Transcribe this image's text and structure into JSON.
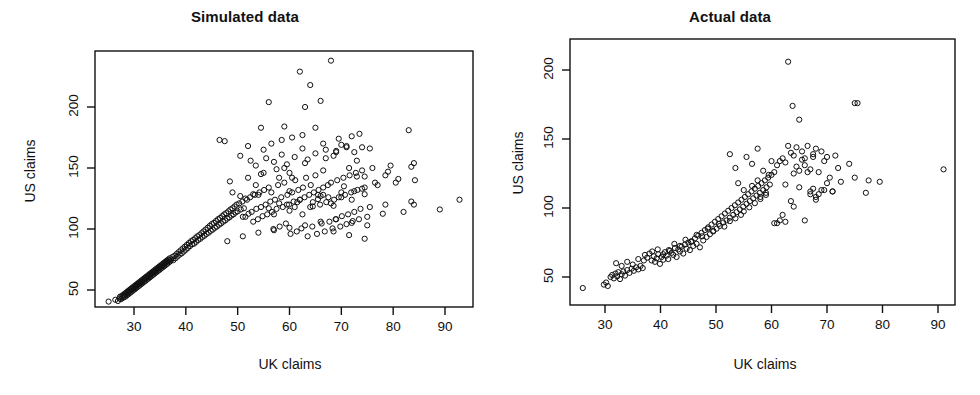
{
  "figure": {
    "width": 980,
    "height": 395,
    "background": "#ffffff",
    "foreground": "#111111",
    "marker": {
      "shape": "open-circle",
      "radius": 2.6,
      "stroke": "#111111",
      "stroke_width": 1.0
    }
  },
  "panels": [
    {
      "id": "left",
      "title": "Simulated data",
      "xlabel": "UK claims",
      "ylabel": "US claims"
    },
    {
      "id": "right",
      "title": "Actual data",
      "xlabel": "UK claims",
      "ylabel": "US claims"
    }
  ],
  "chart_data": [
    {
      "type": "scatter",
      "title": "Simulated data",
      "xlabel": "UK claims",
      "ylabel": "US claims",
      "xticks": [
        30,
        40,
        50,
        60,
        70,
        80,
        90
      ],
      "yticks": [
        50,
        100,
        150,
        200
      ],
      "xlim": [
        23.0,
        96.0
      ],
      "ylim": [
        33.0,
        245.0
      ],
      "grid": false,
      "legend": null,
      "n_points": 700,
      "point_marker": "open circle",
      "description": "Dense positively correlated cloud fanning out; tight narrow band from (25,40) up to about (50,100), widening strongly beyond UK=50 with spread from US~75 to US~240; sparse high-leverage points out to UK~93.",
      "x": [
        25.1,
        26.4,
        26.9,
        27.2,
        27.3,
        27.5,
        27.6,
        27.8,
        27.9,
        28.0,
        28.1,
        28.2,
        28.3,
        28.4,
        28.5,
        28.6,
        28.7,
        28.8,
        28.9,
        29.0,
        29.1,
        29.2,
        29.3,
        29.4,
        29.5,
        29.6,
        29.7,
        29.8,
        29.9,
        30.0,
        30.1,
        30.2,
        30.3,
        30.4,
        30.5,
        30.6,
        30.7,
        30.8,
        30.9,
        31.0,
        31.1,
        31.2,
        31.3,
        31.4,
        31.5,
        31.6,
        31.7,
        31.8,
        31.9,
        32.0,
        32.1,
        32.2,
        32.3,
        32.4,
        32.5,
        32.6,
        32.7,
        32.8,
        32.9,
        33.0,
        33.1,
        33.2,
        33.3,
        33.4,
        33.5,
        33.6,
        33.7,
        33.8,
        33.9,
        34.0,
        34.1,
        34.2,
        34.3,
        34.4,
        34.5,
        34.6,
        34.7,
        34.8,
        34.9,
        35.0,
        35.1,
        35.2,
        35.3,
        35.4,
        35.5,
        35.6,
        35.7,
        35.8,
        35.9,
        36.0,
        36.1,
        36.2,
        36.3,
        36.4,
        36.5,
        36.6,
        36.7,
        36.8,
        36.9,
        37.0,
        37.2,
        37.4,
        37.6,
        37.8,
        38.0,
        38.2,
        38.4,
        38.6,
        38.8,
        39.0,
        39.2,
        39.4,
        39.6,
        39.8,
        40.0,
        40.2,
        40.4,
        40.6,
        40.8,
        41.0,
        41.2,
        41.4,
        41.6,
        41.8,
        42.0,
        42.2,
        42.4,
        42.6,
        42.8,
        43.0,
        43.2,
        43.4,
        43.6,
        43.8,
        44.0,
        44.2,
        44.4,
        44.6,
        44.8,
        45.0,
        45.2,
        45.4,
        45.6,
        45.8,
        46.0,
        46.2,
        46.4,
        46.6,
        46.8,
        47.0,
        47.2,
        47.4,
        47.6,
        47.8,
        48.0,
        48.2,
        48.4,
        48.6,
        48.8,
        49.0,
        49.2,
        49.4,
        49.6,
        49.8,
        50.0,
        50.3,
        50.6,
        50.9,
        51.2,
        51.5,
        51.8,
        52.1,
        52.4,
        52.7,
        53.0,
        53.3,
        53.6,
        53.9,
        54.2,
        54.5,
        54.8,
        55.1,
        55.4,
        55.7,
        56.0,
        56.3,
        56.6,
        56.9,
        57.2,
        57.5,
        57.8,
        58.1,
        58.4,
        58.7,
        59.0,
        59.3,
        59.6,
        59.9,
        60.2,
        60.5,
        60.8,
        61.1,
        61.4,
        61.7,
        62.0,
        62.3,
        62.6,
        62.9,
        63.2,
        63.5,
        63.8,
        64.1,
        64.4,
        64.7,
        65.0,
        65.3,
        65.6,
        65.9,
        66.2,
        66.5,
        66.8,
        67.1,
        67.4,
        67.7,
        68.0,
        68.3,
        68.6,
        68.9,
        69.2,
        69.5,
        69.8,
        70.1,
        70.4,
        70.7,
        71.0,
        71.3,
        71.6,
        71.9,
        72.2,
        72.5,
        72.8,
        73.1,
        73.4,
        73.7,
        74.0,
        74.5,
        75.0,
        75.5,
        76.0,
        77.0,
        78.0,
        78.5,
        79.5,
        80.5,
        82.0,
        83.5,
        84.0,
        84.2,
        89.0,
        92.8,
        52.5,
        60.5,
        64.5,
        67.5,
        78.5,
        84.0,
        53.0,
        60.0,
        61.5,
        65.5,
        66.5,
        70.0,
        71.5,
        74.5,
        49.0,
        51.0,
        52.0,
        54.0,
        55.0,
        56.0,
        57.0,
        58.0,
        59.0,
        60.0,
        61.0,
        62.0,
        63.0,
        64.0,
        65.0,
        66.0,
        67.0,
        68.0,
        69.0,
        70.0,
        71.0,
        72.0,
        73.0,
        74.0,
        46.5,
        47.5,
        48.5,
        50.5,
        51.5,
        53.5,
        54.5,
        55.5,
        57.5,
        58.5,
        59.5,
        62.5,
        63.5,
        66.5,
        68.5,
        69.5,
        72.5,
        73.5,
        75.5,
        83.0,
        52.0,
        54.5,
        56.5,
        58.5,
        60.5,
        62.5,
        64.5,
        66.5,
        68.5,
        70.5,
        72.5,
        74.5,
        76.5,
        79.0,
        81.0,
        83.5,
        55.0,
        57.0,
        59.0,
        61.0,
        63.0,
        65.0,
        67.0,
        69.0,
        71.0,
        73.0,
        56.0,
        58.0,
        60.0,
        62.0,
        64.0,
        66.0,
        68.0,
        70.0,
        72.0,
        74.0,
        50.5,
        53.5,
        56.5,
        59.5,
        62.5,
        65.5,
        68.5,
        71.5,
        74.5,
        48.0,
        51.0,
        54.0,
        57.0,
        60.0,
        63.0,
        66.0,
        69.0,
        72.0,
        75.0
      ],
      "y": [
        40.5,
        42.0,
        41.0,
        43.0,
        44.5,
        42.5,
        45.0,
        43.5,
        46.0,
        44.0,
        45.5,
        47.0,
        44.5,
        46.5,
        48.0,
        45.5,
        47.5,
        49.0,
        46.5,
        48.5,
        50.0,
        47.5,
        49.5,
        51.0,
        48.5,
        50.5,
        52.0,
        49.5,
        51.5,
        53.0,
        50.5,
        52.5,
        54.0,
        51.5,
        53.5,
        55.0,
        52.5,
        54.5,
        56.0,
        53.5,
        55.5,
        57.0,
        54.5,
        56.5,
        58.0,
        55.5,
        57.5,
        59.0,
        56.5,
        58.5,
        60.0,
        57.5,
        59.5,
        61.0,
        58.5,
        60.5,
        62.0,
        59.5,
        61.5,
        63.0,
        60.5,
        62.5,
        64.0,
        61.5,
        63.5,
        65.0,
        62.5,
        64.5,
        66.0,
        63.5,
        65.5,
        67.0,
        64.5,
        66.5,
        68.0,
        65.5,
        67.5,
        69.0,
        66.5,
        68.5,
        70.0,
        67.5,
        69.5,
        71.0,
        68.5,
        70.5,
        72.0,
        69.5,
        71.5,
        73.0,
        70.5,
        72.5,
        74.0,
        71.5,
        73.5,
        75.0,
        72.5,
        74.5,
        76.0,
        73.5,
        75.0,
        77.0,
        74.5,
        78.0,
        76.0,
        79.5,
        77.5,
        81.0,
        79.0,
        82.5,
        80.0,
        84.0,
        81.5,
        85.5,
        83.0,
        87.0,
        84.5,
        88.5,
        86.0,
        90.0,
        87.5,
        91.0,
        88.0,
        92.5,
        89.5,
        94.0,
        91.0,
        95.0,
        92.0,
        96.5,
        93.5,
        98.0,
        94.5,
        99.5,
        96.0,
        101.0,
        97.0,
        102.5,
        98.5,
        104.0,
        99.5,
        105.0,
        101.0,
        106.5,
        102.0,
        108.0,
        103.5,
        109.0,
        104.5,
        110.5,
        106.0,
        112.0,
        107.0,
        113.0,
        108.5,
        114.5,
        109.5,
        116.0,
        111.0,
        117.0,
        112.0,
        118.5,
        113.5,
        120.0,
        114.5,
        121.0,
        116.0,
        122.5,
        117.0,
        110.0,
        124.0,
        112.5,
        126.0,
        114.0,
        106.0,
        128.0,
        116.5,
        108.0,
        130.0,
        118.0,
        110.5,
        132.0,
        120.0,
        112.0,
        134.0,
        122.5,
        114.0,
        100.0,
        124.0,
        116.5,
        136.0,
        102.0,
        126.0,
        118.0,
        138.0,
        104.5,
        128.0,
        120.0,
        96.0,
        130.0,
        122.5,
        140.0,
        98.0,
        132.0,
        124.0,
        100.5,
        134.0,
        126.0,
        142.0,
        94.0,
        128.0,
        136.0,
        102.0,
        130.0,
        144.0,
        96.0,
        132.0,
        120.0,
        104.5,
        134.0,
        98.0,
        122.0,
        136.0,
        106.0,
        138.0,
        100.5,
        124.0,
        108.0,
        140.0,
        126.0,
        102.0,
        110.5,
        142.0,
        128.0,
        104.0,
        112.0,
        144.0,
        130.0,
        106.5,
        114.0,
        146.0,
        132.0,
        108.0,
        116.5,
        148.0,
        134.0,
        110.0,
        118.0,
        150.0,
        136.0,
        112.5,
        120.0,
        152.0,
        138.0,
        114.0,
        122.5,
        154.0,
        140.0,
        116.0,
        124.0,
        156.0,
        142.0,
        118.5,
        126.0,
        144.0,
        120.0,
        128.5,
        146.0,
        122.0,
        124.5,
        148.0,
        126.0,
        150.0,
        128.5,
        130.0,
        110.0,
        142.0,
        128.0,
        165.0,
        204.0,
        112.0,
        142.0,
        184.0,
        131.0,
        118.0,
        229.0,
        200.0,
        218.0,
        183.0,
        205.0,
        165.0,
        238.0,
        163.0,
        169.0,
        168.0,
        176.0,
        156.0,
        167.0,
        173.0,
        172.0,
        139.0,
        160.0,
        125.0,
        152.0,
        145.0,
        158.0,
        149.0,
        161.0,
        153.0,
        166.0,
        157.0,
        170.0,
        160.0,
        174.0,
        163.0,
        178.0,
        166.0,
        181.0,
        168.0,
        183.0,
        170.0,
        173.0,
        175.0,
        177.0,
        122.0,
        128.0,
        119.0,
        135.0,
        131.0,
        143.0,
        138.0,
        147.0,
        141.0,
        151.0,
        146.0,
        155.0,
        150.0,
        159.0,
        154.0,
        162.0,
        158.0,
        164.0,
        167.0,
        143.0,
        117.0,
        121.0,
        115.0,
        124.0,
        118.0,
        127.0,
        121.0,
        130.0,
        124.0,
        133.0,
        127.0,
        136.0,
        130.0,
        120.0,
        112.0,
        128.0,
        98.0,
        95.0,
        92.0,
        90.0,
        94.0,
        97.0,
        99.0,
        101.0,
        103.0,
        106.0,
        108.0,
        105.0,
        103.0,
        100.0,
        98.0,
        96.0,
        94.0,
        93.0,
        95.0,
        97.0,
        86.0,
        84.0,
        82.0,
        85.0,
        88.0,
        91.0,
        95.0,
        99.0,
        102.0,
        78.0,
        80.0,
        83.0,
        86.0,
        80.0,
        88.0,
        92.0,
        97.0,
        100.0,
        104.0
      ]
    },
    {
      "type": "scatter",
      "title": "Actual data",
      "xlabel": "UK claims",
      "ylabel": "US claims",
      "xticks": [
        30,
        40,
        50,
        60,
        70,
        80,
        90
      ],
      "yticks": [
        50,
        100,
        150,
        200
      ],
      "xlim": [
        24.0,
        94.0
      ],
      "ylim": [
        36.0,
        212.0
      ],
      "grid": false,
      "legend": null,
      "n_points": 210,
      "point_marker": "open circle",
      "description": "Sparser positively correlated cloud, tight band from (26,42) up to about (55,110), fanning above UK=55 with spread US~90-145; isolated outliers near (63,206), (64,174), (75,176), (65,164); far right point near (91,128).",
      "x": [
        26.0,
        29.8,
        30.2,
        30.5,
        31.0,
        31.3,
        31.6,
        31.9,
        32.2,
        32.4,
        32.7,
        33.0,
        33.3,
        33.6,
        34.0,
        34.4,
        34.8,
        35.2,
        35.6,
        36.0,
        36.4,
        36.8,
        37.2,
        37.6,
        38.0,
        38.4,
        38.8,
        39.0,
        39.3,
        39.6,
        39.9,
        40.2,
        40.5,
        40.8,
        41.1,
        41.4,
        41.7,
        42.0,
        42.3,
        42.6,
        42.9,
        43.2,
        43.5,
        43.8,
        44.1,
        44.4,
        44.7,
        45.0,
        45.3,
        45.6,
        45.9,
        46.2,
        46.5,
        46.8,
        47.1,
        47.4,
        47.7,
        48.0,
        48.3,
        48.6,
        48.9,
        49.2,
        49.5,
        49.8,
        50.1,
        50.4,
        50.7,
        51.0,
        51.3,
        51.6,
        51.9,
        52.2,
        52.5,
        52.8,
        53.1,
        53.4,
        53.7,
        54.0,
        54.3,
        54.6,
        54.9,
        55.2,
        55.5,
        55.8,
        56.1,
        56.4,
        56.7,
        57.0,
        57.3,
        57.6,
        57.9,
        58.2,
        58.5,
        58.8,
        59.1,
        59.4,
        59.7,
        60.0,
        32.0,
        33.0,
        34.0,
        35.0,
        36.0,
        37.0,
        38.5,
        39.5,
        40.5,
        41.5,
        42.5,
        43.5,
        44.5,
        45.5,
        46.5,
        47.5,
        48.5,
        49.5,
        50.5,
        51.5,
        52.5,
        53.5,
        54.5,
        55.0,
        56.0,
        57.0,
        58.0,
        59.0,
        52.5,
        53.5,
        55.5,
        56.5,
        57.5,
        58.5,
        59.5,
        54.0,
        55.0,
        56.5,
        57.5,
        58.0,
        59.0,
        60.5,
        61.0,
        61.5,
        62.0,
        62.5,
        63.0,
        63.5,
        64.0,
        64.5,
        65.0,
        65.5,
        66.0,
        66.5,
        67.0,
        67.5,
        68.0,
        68.5,
        69.0,
        69.5,
        70.0,
        71.0,
        71.5,
        72.5,
        74.0,
        75.0,
        75.5,
        77.0,
        77.5,
        79.5,
        91.0,
        63.0,
        63.8,
        65.0,
        75.0,
        62.5,
        64.0,
        66.0,
        67.5,
        69.0,
        71.0,
        60.5,
        61.5,
        63.5,
        66.5,
        68.0,
        70.5,
        62.0,
        64.5,
        65.5,
        67.0,
        68.5,
        70.0,
        60.0,
        61.0,
        62.5,
        64.0,
        66.0,
        67.5,
        69.5,
        72.0,
        65.0,
        67.0,
        68.0
      ],
      "y": [
        42.0,
        44.5,
        46.0,
        43.5,
        50.0,
        51.5,
        49.0,
        52.5,
        50.5,
        53.5,
        48.5,
        52.0,
        54.0,
        51.0,
        55.0,
        53.0,
        56.0,
        54.5,
        57.0,
        55.5,
        58.0,
        56.5,
        66.0,
        64.0,
        67.0,
        62.0,
        65.0,
        61.0,
        63.5,
        66.5,
        59.5,
        64.5,
        62.5,
        68.0,
        65.5,
        63.0,
        69.0,
        67.5,
        66.0,
        71.0,
        64.5,
        70.0,
        68.5,
        72.0,
        67.0,
        73.5,
        70.5,
        75.0,
        69.5,
        76.0,
        72.5,
        78.0,
        74.0,
        80.0,
        71.5,
        82.0,
        76.5,
        84.0,
        79.0,
        86.0,
        81.0,
        88.0,
        83.5,
        90.0,
        85.0,
        92.0,
        87.0,
        94.0,
        89.5,
        96.0,
        91.0,
        98.0,
        93.0,
        100.0,
        95.0,
        102.0,
        97.0,
        104.0,
        99.0,
        106.0,
        101.0,
        108.0,
        103.0,
        110.0,
        105.0,
        112.0,
        107.0,
        114.0,
        109.0,
        116.0,
        111.0,
        118.0,
        113.0,
        120.0,
        115.0,
        122.0,
        117.0,
        124.0,
        60.0,
        58.0,
        61.0,
        59.0,
        63.0,
        62.0,
        68.5,
        70.0,
        66.5,
        69.5,
        74.0,
        72.5,
        77.0,
        75.5,
        80.5,
        79.5,
        85.0,
        83.0,
        88.5,
        86.5,
        90.5,
        92.5,
        95.0,
        97.5,
        100.5,
        103.5,
        106.5,
        109.5,
        139.0,
        129.0,
        137.0,
        132.0,
        143.0,
        127.0,
        124.0,
        118.0,
        113.0,
        116.0,
        120.0,
        108.0,
        111.0,
        126.0,
        131.0,
        134.0,
        136.0,
        133.0,
        145.0,
        140.0,
        138.0,
        144.0,
        127.0,
        141.0,
        136.0,
        145.0,
        112.0,
        139.0,
        143.0,
        110.0,
        141.0,
        113.0,
        137.0,
        112.0,
        138.0,
        119.0,
        132.0,
        122.0,
        176.0,
        111.0,
        120.0,
        119.0,
        128.0,
        206.0,
        174.0,
        164.0,
        176.0,
        117.0,
        101.0,
        91.0,
        114.0,
        113.0,
        112.0,
        89.0,
        91.0,
        105.0,
        126.0,
        106.0,
        122.0,
        95.0,
        130.0,
        135.0,
        128.0,
        126.0,
        118.0,
        134.0,
        89.0,
        90.0,
        125.0,
        131.0,
        137.0,
        134.0,
        129.0,
        115.0,
        110.0,
        108.0,
        112.0
      ]
    }
  ]
}
